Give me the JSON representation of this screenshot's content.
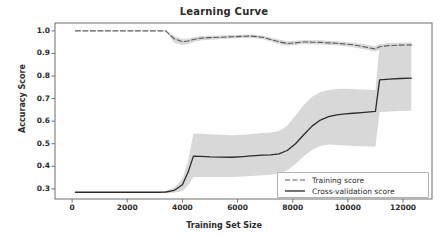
{
  "chart_data": {
    "type": "line",
    "title": "Learning Curve",
    "xlabel": "Training Set Size",
    "ylabel": "Accuracy Score",
    "xlim": [
      -620,
      13050
    ],
    "ylim": [
      0.255,
      1.035
    ],
    "xticks": [
      0,
      2000,
      4000,
      6000,
      8000,
      10000,
      12000
    ],
    "xtick_labels": [
      "0",
      "2000",
      "4000",
      "6000",
      "8000",
      "10000",
      "12000"
    ],
    "yticks": [
      0.3,
      0.4,
      0.5,
      0.6,
      0.7,
      0.8,
      0.9,
      1.0
    ],
    "ytick_labels": [
      "0.3",
      "0.4",
      "0.5",
      "0.6",
      "0.7",
      "0.8",
      "0.9",
      "1.0"
    ],
    "grid": false,
    "legend_position": "lower right",
    "band_color": "#d8d8d8",
    "train_color": "#5a5a5a",
    "cv_color": "#2b2b2b",
    "x": [
      120,
      700,
      1300,
      1900,
      2500,
      3100,
      3400,
      3700,
      4000,
      4200,
      4400,
      4700,
      5000,
      5400,
      5800,
      6200,
      6500,
      6900,
      7200,
      7500,
      7800,
      8100,
      8400,
      8700,
      9000,
      9300,
      9600,
      9900,
      10200,
      10500,
      10800,
      11000,
      11150,
      11500,
      11900,
      12300
    ],
    "series": [
      {
        "name": "Training score",
        "style": "dashed",
        "values": [
          1.0,
          1.0,
          1.0,
          1.0,
          1.0,
          1.0,
          1.0,
          0.965,
          0.952,
          0.955,
          0.962,
          0.968,
          0.97,
          0.972,
          0.974,
          0.976,
          0.977,
          0.972,
          0.962,
          0.952,
          0.944,
          0.947,
          0.951,
          0.95,
          0.949,
          0.947,
          0.945,
          0.942,
          0.938,
          0.932,
          0.924,
          0.92,
          0.93,
          0.935,
          0.937,
          0.938
        ],
        "band_lower": [
          0.999,
          0.999,
          0.999,
          0.999,
          0.999,
          0.999,
          0.998,
          0.948,
          0.938,
          0.942,
          0.951,
          0.958,
          0.961,
          0.964,
          0.966,
          0.969,
          0.97,
          0.964,
          0.953,
          0.942,
          0.934,
          0.938,
          0.942,
          0.941,
          0.94,
          0.938,
          0.936,
          0.932,
          0.928,
          0.921,
          0.913,
          0.909,
          0.918,
          0.924,
          0.927,
          0.928
        ],
        "band_upper": [
          1.001,
          1.001,
          1.001,
          1.001,
          1.001,
          1.001,
          1.001,
          0.977,
          0.964,
          0.966,
          0.972,
          0.977,
          0.979,
          0.98,
          0.982,
          0.983,
          0.984,
          0.98,
          0.971,
          0.962,
          0.954,
          0.956,
          0.96,
          0.959,
          0.958,
          0.956,
          0.954,
          0.951,
          0.948,
          0.943,
          0.936,
          0.932,
          0.941,
          0.946,
          0.948,
          0.949
        ]
      },
      {
        "name": "Cross-validation score",
        "style": "solid",
        "values": [
          0.285,
          0.285,
          0.285,
          0.285,
          0.285,
          0.285,
          0.286,
          0.293,
          0.318,
          0.372,
          0.445,
          0.444,
          0.442,
          0.441,
          0.44,
          0.443,
          0.446,
          0.449,
          0.451,
          0.455,
          0.47,
          0.5,
          0.54,
          0.578,
          0.605,
          0.62,
          0.628,
          0.632,
          0.635,
          0.638,
          0.641,
          0.643,
          0.783,
          0.786,
          0.789,
          0.791
        ],
        "band_lower": [
          0.284,
          0.284,
          0.284,
          0.284,
          0.284,
          0.284,
          0.283,
          0.283,
          0.29,
          0.315,
          0.352,
          0.352,
          0.352,
          0.352,
          0.353,
          0.355,
          0.357,
          0.36,
          0.363,
          0.368,
          0.382,
          0.41,
          0.445,
          0.472,
          0.49,
          0.496,
          0.494,
          0.492,
          0.49,
          0.489,
          0.488,
          0.488,
          0.64,
          0.643,
          0.645,
          0.646
        ],
        "band_upper": [
          0.286,
          0.286,
          0.286,
          0.286,
          0.286,
          0.286,
          0.29,
          0.305,
          0.345,
          0.42,
          0.545,
          0.544,
          0.542,
          0.54,
          0.538,
          0.54,
          0.543,
          0.547,
          0.55,
          0.556,
          0.58,
          0.625,
          0.672,
          0.708,
          0.728,
          0.738,
          0.742,
          0.744,
          0.742,
          0.74,
          0.739,
          0.738,
          0.938,
          0.942,
          0.944,
          0.945
        ]
      }
    ]
  },
  "legend": {
    "items": [
      {
        "label": "Training score",
        "style": "dashed"
      },
      {
        "label": "Cross-validation score",
        "style": "solid"
      }
    ]
  }
}
